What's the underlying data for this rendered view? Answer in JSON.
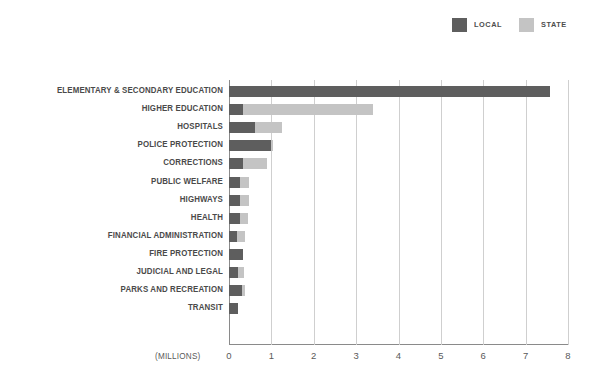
{
  "chart_data": {
    "type": "bar",
    "orientation": "horizontal",
    "stacked": true,
    "title": "",
    "subtitle": "",
    "xlabel": "(MILLIONS)",
    "ylabel": "",
    "xlim": [
      0,
      8
    ],
    "xticks": [
      "0",
      "1",
      "2",
      "3",
      "4",
      "5",
      "6",
      "7",
      "8"
    ],
    "grid": true,
    "legend_position": "top-right",
    "categories": [
      "ELEMENTARY & SECONDARY EDUCATION",
      "HIGHER EDUCATION",
      "HOSPITALS",
      "POLICE PROTECTION",
      "CORRECTIONS",
      "PUBLIC WELFARE",
      "HIGHWAYS",
      "HEALTH",
      "FINANCIAL ADMINISTRATION",
      "FIRE PROTECTION",
      "JUDICIAL AND LEGAL",
      "PARKS AND RECREATION",
      "TRANSIT"
    ],
    "series": [
      {
        "name": "LOCAL",
        "color": "#5e5e5e",
        "values": [
          7.58,
          0.34,
          0.61,
          1.0,
          0.33,
          0.25,
          0.25,
          0.26,
          0.2,
          0.33,
          0.22,
          0.3,
          0.22
        ]
      },
      {
        "name": "STATE",
        "color": "#c4c4c4",
        "values": [
          0.0,
          3.05,
          0.64,
          0.05,
          0.57,
          0.22,
          0.22,
          0.2,
          0.17,
          0.0,
          0.13,
          0.08,
          0.0
        ]
      }
    ],
    "totals": [
      7.58,
      3.39,
      1.25,
      1.05,
      0.9,
      0.47,
      0.47,
      0.46,
      0.37,
      0.33,
      0.35,
      0.38,
      0.22
    ]
  },
  "legend": {
    "items": [
      {
        "label": "LOCAL",
        "color": "#5e5e5e"
      },
      {
        "label": "STATE",
        "color": "#c4c4c4"
      }
    ]
  },
  "axis": {
    "units": "(MILLIONS)"
  }
}
